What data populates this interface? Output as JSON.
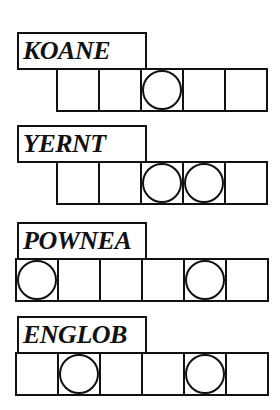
{
  "puzzles": [
    {
      "scrambled": "KOANE",
      "cells": 5,
      "circled": [
        3
      ],
      "top": 32,
      "cells_left": 56
    },
    {
      "scrambled": "YERNT",
      "cells": 5,
      "circled": [
        3,
        4
      ],
      "top": 125,
      "cells_left": 56
    },
    {
      "scrambled": "POWNEA",
      "cells": 6,
      "circled": [
        1,
        5
      ],
      "top": 222,
      "cells_left": 15
    },
    {
      "scrambled": "ENGLOB",
      "cells": 6,
      "circled": [
        2,
        5
      ],
      "top": 316,
      "cells_left": 15
    }
  ],
  "colors": {
    "ink": "#111111",
    "background": "#ffffff"
  }
}
